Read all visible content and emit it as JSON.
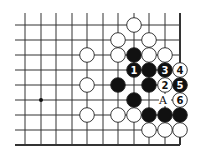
{
  "diagram": {
    "type": "go-board-problem",
    "grid": {
      "columns_x": [
        25,
        41,
        56,
        72,
        87,
        103,
        118,
        134,
        149,
        165,
        180
      ],
      "rows_y": [
        25,
        40,
        55,
        70,
        85,
        100,
        115,
        130,
        145
      ],
      "line_color": "#333333",
      "edge_right": true,
      "edge_bottom": true
    },
    "hoshi": [
      {
        "col": 1,
        "row": 5
      }
    ],
    "stones": [
      {
        "color": "white",
        "col": 7,
        "row": 0,
        "label": ""
      },
      {
        "color": "white",
        "col": 6,
        "row": 1,
        "label": ""
      },
      {
        "color": "white",
        "col": 8,
        "row": 1,
        "label": ""
      },
      {
        "color": "white",
        "col": 4,
        "row": 2,
        "label": ""
      },
      {
        "color": "white",
        "col": 6,
        "row": 2,
        "label": ""
      },
      {
        "color": "black",
        "col": 7,
        "row": 2,
        "label": ""
      },
      {
        "color": "white",
        "col": 8,
        "row": 2,
        "label": ""
      },
      {
        "color": "white",
        "col": 9,
        "row": 2,
        "label": ""
      },
      {
        "color": "black",
        "col": 7,
        "row": 3,
        "label": "1"
      },
      {
        "color": "black",
        "col": 8,
        "row": 3,
        "label": ""
      },
      {
        "color": "black",
        "col": 9,
        "row": 3,
        "label": "3"
      },
      {
        "color": "white",
        "col": 10,
        "row": 3,
        "label": "4"
      },
      {
        "color": "white",
        "col": 4,
        "row": 4,
        "label": ""
      },
      {
        "color": "black",
        "col": 6,
        "row": 4,
        "label": ""
      },
      {
        "color": "black",
        "col": 8,
        "row": 4,
        "label": ""
      },
      {
        "color": "white",
        "col": 9,
        "row": 4,
        "label": "2"
      },
      {
        "color": "black",
        "col": 10,
        "row": 4,
        "label": "5"
      },
      {
        "color": "black",
        "col": 7,
        "row": 5,
        "label": ""
      },
      {
        "color": "white",
        "col": 10,
        "row": 5,
        "label": "6"
      },
      {
        "color": "white",
        "col": 4,
        "row": 6,
        "label": ""
      },
      {
        "color": "white",
        "col": 6,
        "row": 6,
        "label": ""
      },
      {
        "color": "white",
        "col": 7,
        "row": 6,
        "label": ""
      },
      {
        "color": "black",
        "col": 8,
        "row": 6,
        "label": ""
      },
      {
        "color": "black",
        "col": 9,
        "row": 6,
        "label": ""
      },
      {
        "color": "black",
        "col": 10,
        "row": 6,
        "label": ""
      },
      {
        "color": "white",
        "col": 8,
        "row": 7,
        "label": ""
      },
      {
        "color": "white",
        "col": 9,
        "row": 7,
        "label": ""
      },
      {
        "color": "white",
        "col": 10,
        "row": 7,
        "label": ""
      }
    ],
    "marks": [
      {
        "text": "A",
        "col": 9,
        "row": 5
      }
    ]
  }
}
